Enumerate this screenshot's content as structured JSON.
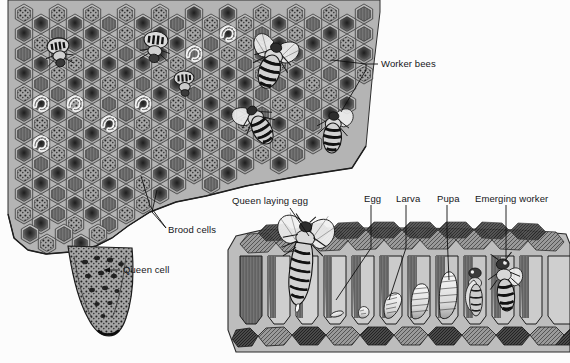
{
  "figure": {
    "style": "grayscale pen-and-ink scientific illustration",
    "background_color": "#fcfcfc",
    "comb_fill": "#b9b9b9",
    "comb_shadow": "#7d7d7d",
    "ink_color": "#1a1a1a",
    "label_color": "#15161a"
  },
  "labels": {
    "worker_bees": "Worker bees",
    "brood_cells": "Brood cells",
    "queen_cell": "Queen cell",
    "queen_laying_egg": "Queen laying egg",
    "egg": "Egg",
    "larva": "Larva",
    "pupa": "Pupa",
    "emerging_worker": "Emerging worker"
  },
  "callouts": [
    {
      "id": "worker-bees",
      "text": "Worker bees",
      "x": 381,
      "y": 64,
      "leader": "bracket-left"
    },
    {
      "id": "brood-cells",
      "text": "Brood cells",
      "x": 168,
      "y": 230,
      "leader": "fan-up-left"
    },
    {
      "id": "queen-cell",
      "text": "Queen cell",
      "x": 123,
      "y": 270,
      "leader": "arrow-left"
    },
    {
      "id": "queen-laying-egg",
      "text": "Queen laying egg",
      "x": 232,
      "y": 202,
      "leader": "diagonal-down-right"
    },
    {
      "id": "egg",
      "text": "Egg",
      "x": 366,
      "y": 199,
      "leader": "vertical-down"
    },
    {
      "id": "larva",
      "text": "Larva",
      "x": 398,
      "y": 199,
      "leader": "vertical-down"
    },
    {
      "id": "pupa",
      "text": "Pupa",
      "x": 440,
      "y": 199,
      "leader": "diagonal-down-right"
    },
    {
      "id": "emerging-worker",
      "text": "Emerging worker",
      "x": 477,
      "y": 199,
      "leader": "vertical-down"
    }
  ],
  "upper_comb": {
    "description": "face-on view of brood comb with hexagonal cells, larvae and worker bees",
    "bounds": {
      "x": 8,
      "y": 0,
      "width": 372,
      "height": 250
    },
    "bee_count": 7
  },
  "lower_comb": {
    "description": "cut-away side view of comb showing brood development stages",
    "bounds": {
      "x": 222,
      "y": 226,
      "width": 348,
      "height": 137
    },
    "stages": [
      "egg",
      "young larva",
      "larva",
      "older larva",
      "pupa",
      "pharate adult",
      "emerging worker"
    ],
    "cell_count": 10
  }
}
